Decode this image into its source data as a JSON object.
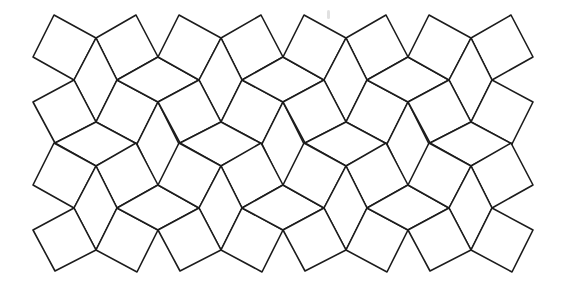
{
  "figure": {
    "background": "#ffffff",
    "stroke": "#1c1c1c",
    "unit_centers_x": [
      96,
      221,
      346,
      471
    ],
    "row_offsets_y": [
      0,
      128
    ],
    "tile_templates": {
      "square_top_left": [
        [
          -42,
          15
        ],
        [
          0,
          38
        ],
        [
          -22,
          80
        ],
        [
          -63,
          57
        ]
      ],
      "square_top_right": [
        [
          0,
          38
        ],
        [
          40,
          15
        ],
        [
          62,
          57
        ],
        [
          21,
          80
        ]
      ],
      "rhombus_vertical": [
        [
          0,
          38
        ],
        [
          21,
          80
        ],
        [
          0,
          122
        ],
        [
          -22,
          80
        ]
      ],
      "rhombus_between": [
        [
          21,
          80
        ],
        [
          62,
          57
        ],
        [
          103,
          80
        ],
        [
          62,
          102
        ]
      ],
      "square_mid_left": [
        [
          -22,
          80
        ],
        [
          0,
          122
        ],
        [
          -41,
          143
        ],
        [
          -63,
          102
        ]
      ],
      "square_mid_right": [
        [
          21,
          80
        ],
        [
          62,
          102
        ],
        [
          41,
          144
        ],
        [
          0,
          122
        ]
      ],
      "rhombus_bottom": [
        [
          0,
          122
        ],
        [
          41,
          144
        ],
        [
          0,
          166
        ],
        [
          -41,
          143
        ]
      ],
      "rhombus_bottom_between": [
        [
          62,
          102
        ],
        [
          83,
          144
        ],
        [
          62,
          187
        ],
        [
          41,
          144
        ]
      ]
    },
    "rows": [
      {
        "row": 0,
        "all_units": [
          "square_top_left",
          "square_top_right",
          "rhombus_vertical",
          "square_mid_left",
          "square_mid_right",
          "rhombus_bottom"
        ],
        "inner_units_only": [
          "rhombus_between",
          "rhombus_bottom_between"
        ]
      },
      {
        "row": 1,
        "all_units": [
          "square_top_left",
          "square_top_right",
          "rhombus_vertical",
          "square_mid_left",
          "square_mid_right"
        ],
        "inner_units_only": [
          "rhombus_between"
        ]
      }
    ],
    "artifacts": [
      {
        "x": 327,
        "y": 10,
        "w": 3,
        "h": 9
      }
    ]
  }
}
